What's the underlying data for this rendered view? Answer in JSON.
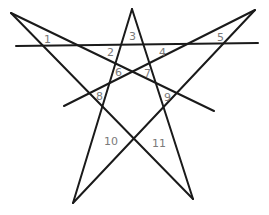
{
  "diagram": {
    "title": "",
    "line_color": "#1a1a1a",
    "label_color": "#7a7a7a",
    "lines": [
      {
        "id": "line-1",
        "x1": 11,
        "y1": 13,
        "x2": 214,
        "y2": 111
      },
      {
        "id": "line-2",
        "x1": 255,
        "y1": 10,
        "x2": 64,
        "y2": 106
      },
      {
        "id": "line-3",
        "x1": 132,
        "y1": 9,
        "x2": 73,
        "y2": 203
      },
      {
        "id": "line-4",
        "x1": 132,
        "y1": 9,
        "x2": 193,
        "y2": 199
      },
      {
        "id": "line-5",
        "x1": 11,
        "y1": 13,
        "x2": 193,
        "y2": 199
      },
      {
        "id": "line-6",
        "x1": 255,
        "y1": 10,
        "x2": 73,
        "y2": 203
      },
      {
        "id": "horizontal-line",
        "x1": 16,
        "y1": 46,
        "x2": 258,
        "y2": 43
      }
    ],
    "labels": [
      {
        "text": "1",
        "x": 44,
        "y": 43
      },
      {
        "text": "2",
        "x": 107,
        "y": 56
      },
      {
        "text": "3",
        "x": 129,
        "y": 40
      },
      {
        "text": "4",
        "x": 159,
        "y": 56
      },
      {
        "text": "5",
        "x": 217,
        "y": 41
      },
      {
        "text": "6",
        "x": 115,
        "y": 76
      },
      {
        "text": "7",
        "x": 144,
        "y": 77
      },
      {
        "text": "8",
        "x": 96,
        "y": 100
      },
      {
        "text": "9",
        "x": 164,
        "y": 101
      },
      {
        "text": "10",
        "x": 104,
        "y": 145
      },
      {
        "text": "11",
        "x": 152,
        "y": 147
      }
    ]
  }
}
